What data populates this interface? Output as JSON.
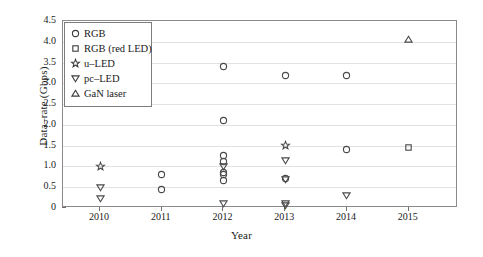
{
  "chart_data": {
    "type": "scatter",
    "title": "",
    "xlabel": "Year",
    "ylabel": "Data–rate (Gbps)",
    "xlim": [
      2009.4,
      2015.8
    ],
    "ylim": [
      0,
      4.5
    ],
    "xticks": [
      "2010",
      "2011",
      "2012",
      "2013",
      "2014",
      "2015"
    ],
    "yticks": [
      "0",
      "0.5",
      "1.0",
      "1.5",
      "2.0",
      "2.5",
      "3.0",
      "3.5",
      "4.0",
      "4.5"
    ],
    "grid": "horizontal",
    "legend_position": "upper-left-inside",
    "series": [
      {
        "name": "RGB",
        "marker": "circle",
        "points": [
          {
            "x": 2011,
            "y": 0.8
          },
          {
            "x": 2011,
            "y": 0.45
          },
          {
            "x": 2012,
            "y": 3.4
          },
          {
            "x": 2012,
            "y": 2.1
          },
          {
            "x": 2012,
            "y": 1.27
          },
          {
            "x": 2012,
            "y": 1.13
          },
          {
            "x": 2012,
            "y": 0.85
          },
          {
            "x": 2012,
            "y": 0.8
          },
          {
            "x": 2012,
            "y": 0.66
          },
          {
            "x": 2013,
            "y": 3.2
          },
          {
            "x": 2013,
            "y": 0.72
          },
          {
            "x": 2014,
            "y": 3.2
          },
          {
            "x": 2014,
            "y": 1.4
          }
        ]
      },
      {
        "name": "RGB (red LED)",
        "marker": "square",
        "points": [
          {
            "x": 2015,
            "y": 1.45
          }
        ]
      },
      {
        "name": "u–LED",
        "marker": "star",
        "points": [
          {
            "x": 2010,
            "y": 1.0
          },
          {
            "x": 2013,
            "y": 1.5
          }
        ]
      },
      {
        "name": "pc–LED",
        "marker": "triangle-down",
        "points": [
          {
            "x": 2010,
            "y": 0.5
          },
          {
            "x": 2010,
            "y": 0.22
          },
          {
            "x": 2012,
            "y": 1.0
          },
          {
            "x": 2012,
            "y": 0.1
          },
          {
            "x": 2013,
            "y": 1.15
          },
          {
            "x": 2013,
            "y": 0.68
          },
          {
            "x": 2013,
            "y": 0.12
          },
          {
            "x": 2013,
            "y": 0.05
          },
          {
            "x": 2014,
            "y": 0.3
          }
        ]
      },
      {
        "name": "GaN laser",
        "marker": "triangle-up",
        "points": [
          {
            "x": 2015,
            "y": 4.05
          }
        ]
      }
    ]
  },
  "legend": {
    "items": [
      {
        "label": "RGB",
        "marker": "circle"
      },
      {
        "label": "RGB (red LED)",
        "marker": "square"
      },
      {
        "label": "u–LED",
        "marker": "star"
      },
      {
        "label": "pc–LED",
        "marker": "triangle-down"
      },
      {
        "label": "GaN laser",
        "marker": "triangle-up"
      }
    ]
  },
  "colors": {
    "marker_stroke": "#4a4a4a",
    "axis": "#8a8a8a",
    "grid": "#e2e2e2",
    "text": "#1a1a1a",
    "background": "#ffffff"
  }
}
